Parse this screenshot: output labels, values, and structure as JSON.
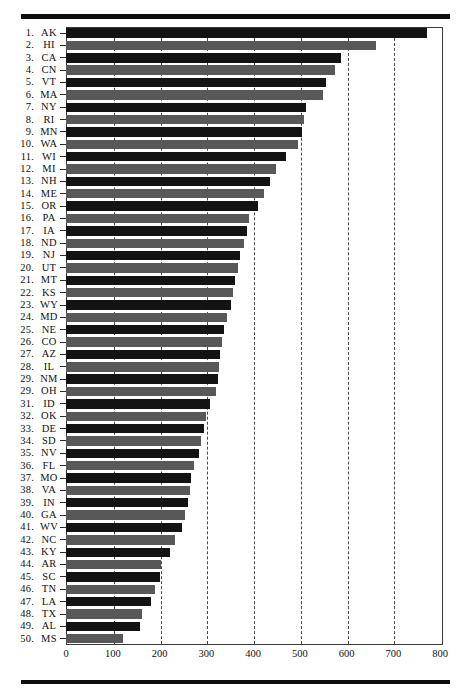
{
  "figure": {
    "type": "horizontal-bar-chart",
    "orientation": "horizontal",
    "rank_suffix": "."
  },
  "axis": {
    "xlabel": "",
    "ylabel": "",
    "xmin": 0,
    "xmax": 800,
    "ticks": [
      0,
      100,
      200,
      300,
      400,
      500,
      600,
      700,
      800
    ],
    "tick_labels": [
      "0",
      "100",
      "200",
      "300",
      "400",
      "500",
      "600",
      "700",
      "800"
    ],
    "gridlines_at": [
      100,
      200,
      300,
      400,
      500,
      600,
      700
    ],
    "grid_style": "dashed"
  },
  "style": {
    "bar_dark": "#131313",
    "bar_light": "#585858",
    "frame": "#3a3a3a",
    "grid": "#4a4a4a",
    "rule": "#0d0d0d",
    "background": "#ffffff"
  },
  "chart_data": {
    "type": "bar",
    "title": "",
    "subtitle": "",
    "xlabel": "",
    "ylabel": "",
    "xlim": [
      0,
      800
    ],
    "grid": true,
    "legend": "none",
    "orientation": "horizontal",
    "sorted": "descending",
    "categories": [
      "AK",
      "HI",
      "CA",
      "CN",
      "VT",
      "MA",
      "NY",
      "RI",
      "MN",
      "WA",
      "WI",
      "MI",
      "NH",
      "ME",
      "OR",
      "PA",
      "IA",
      "ND",
      "NJ",
      "UT",
      "MT",
      "KS",
      "WY",
      "MD",
      "NE",
      "CO",
      "AZ",
      "IL",
      "NM",
      "OH",
      "ID",
      "OK",
      "DE",
      "SD",
      "NV",
      "FL",
      "MO",
      "VA",
      "IN",
      "GA",
      "WV",
      "NC",
      "KY",
      "AR",
      "SC",
      "TN",
      "LA",
      "TX",
      "AL",
      "MS"
    ],
    "ranks": [
      "1.",
      "2.",
      "3.",
      "4.",
      "5.",
      "6.",
      "7.",
      "8.",
      "9.",
      "10.",
      "11.",
      "12.",
      "13.",
      "14.",
      "15.",
      "16.",
      "17.",
      "18.",
      "19.",
      "20.",
      "21.",
      "22.",
      "23.",
      "24.",
      "25.",
      "26.",
      "27.",
      "28.",
      "29.",
      "29.",
      "31.",
      "32.",
      "33.",
      "34.",
      "35.",
      "36.",
      "37.",
      "38.",
      "39.",
      "40.",
      "41.",
      "42.",
      "43.",
      "44.",
      "45.",
      "46.",
      "47.",
      "48.",
      "49.",
      "50."
    ],
    "values": [
      772,
      663,
      588,
      575,
      557,
      549,
      514,
      510,
      505,
      497,
      470,
      450,
      436,
      424,
      410,
      391,
      388,
      380,
      372,
      367,
      362,
      358,
      353,
      344,
      339,
      334,
      330,
      327,
      325,
      321,
      307,
      299,
      296,
      289,
      284,
      273,
      268,
      265,
      262,
      255,
      249,
      233,
      222,
      204,
      202,
      190,
      182,
      163,
      158,
      122
    ],
    "bar_shades": [
      "dark",
      "light",
      "dark",
      "light",
      "dark",
      "light",
      "dark",
      "light",
      "dark",
      "light",
      "dark",
      "light",
      "dark",
      "light",
      "dark",
      "light",
      "dark",
      "light",
      "dark",
      "light",
      "dark",
      "light",
      "dark",
      "light",
      "dark",
      "light",
      "dark",
      "light",
      "dark",
      "light",
      "dark",
      "light",
      "dark",
      "light",
      "dark",
      "light",
      "dark",
      "light",
      "dark",
      "light",
      "dark",
      "light",
      "dark",
      "light",
      "dark",
      "light",
      "dark",
      "light",
      "dark",
      "light"
    ]
  }
}
